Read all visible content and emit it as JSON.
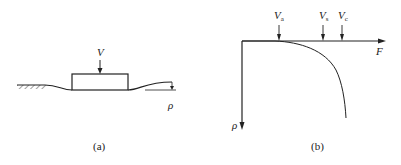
{
  "panel_a": {
    "caption": "(a)",
    "load_label": "V",
    "settlement_label": "ρ"
  },
  "panel_b": {
    "caption": "(b)",
    "x_axis_label": "F",
    "y_axis_label": "ρ",
    "markers": [
      {
        "base": "V",
        "sub": "a"
      },
      {
        "base": "V",
        "sub": "s"
      },
      {
        "base": "V",
        "sub": "c"
      }
    ]
  }
}
